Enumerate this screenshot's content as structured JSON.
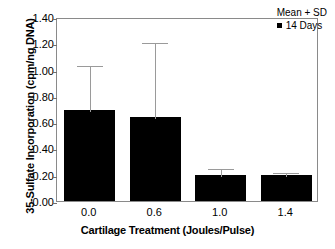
{
  "chart_data": {
    "type": "bar",
    "title": "",
    "xlabel": "Cartilage Treatment (Joules/Pulse)",
    "ylabel": "35-Sulfate Incorporation (cpm/ng DNA)",
    "categories": [
      "0.0",
      "0.6",
      "1.0",
      "1.4"
    ],
    "values": [
      0.69,
      0.64,
      0.2,
      0.2
    ],
    "errors": [
      0.35,
      0.58,
      0.06,
      0.03
    ],
    "error_type": "SD",
    "error_direction": "upper",
    "ylim": [
      0.0,
      1.4
    ],
    "yticks": [
      "0.00",
      "0.20",
      "0.40",
      "0.60",
      "0.80",
      "1.00",
      "1.20",
      "1.40"
    ],
    "ytick_values": [
      0.0,
      0.2,
      0.4,
      0.6,
      0.8,
      1.0,
      1.2,
      1.4
    ],
    "grid": false,
    "legend": {
      "position": "top-right",
      "title": "Mean + SD",
      "entries": [
        {
          "label": "14 Days",
          "color": "#000000",
          "marker": "square"
        }
      ]
    },
    "series": [
      {
        "name": "14 Days",
        "color": "#000000",
        "values": [
          0.69,
          0.64,
          0.2,
          0.2
        ],
        "errors": [
          0.35,
          0.58,
          0.06,
          0.03
        ]
      }
    ],
    "bar_color": "#000000",
    "error_bar_color": "#9a9a9a",
    "axis_color": "#8a8a8a",
    "background": "#ffffff"
  },
  "caption": {
    "text": ""
  }
}
